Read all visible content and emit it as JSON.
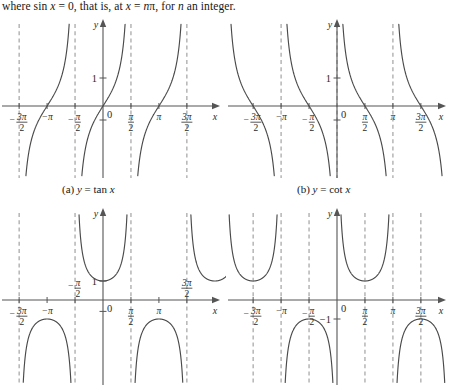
{
  "page": {
    "width": 452,
    "height": 387,
    "background": "#ffffff",
    "ink": "#2b2b2b",
    "axis_color": "#555555",
    "curve_color": "#4a4a4a",
    "asymptote_color": "#9a9a9a"
  },
  "intro": {
    "text_parts": [
      "where sin ",
      "x",
      " = 0, that is, at ",
      "x",
      " = ",
      "n",
      "π, for ",
      "n",
      " an integer."
    ],
    "full_text": "where sin x = 0, that is, at x = nπ, for n an integer."
  },
  "captions": {
    "a": {
      "prefix": "(a) ",
      "y": "y",
      "eq": " = tan ",
      "x": "x",
      "full": "(a) y = tan x"
    },
    "b": {
      "prefix": "(b) ",
      "y": "y",
      "eq": " = cot ",
      "x": "x",
      "full": "(b) y = cot x"
    }
  },
  "axis_labels": {
    "x": "x",
    "y": "y",
    "zero": "0",
    "one": "1",
    "neg_one": "−1"
  },
  "tick_labels": {
    "neg_3pi_over_2": {
      "sign": "−",
      "num": "3π",
      "den": "2"
    },
    "neg_pi": {
      "sign": "−",
      "num": "π",
      "den": ""
    },
    "neg_pi_over_2": {
      "sign": "−",
      "num": "π",
      "den": "2"
    },
    "pi_over_2": {
      "sign": "",
      "num": "π",
      "den": "2"
    },
    "pi": {
      "sign": "",
      "num": "π",
      "den": ""
    },
    "3pi_over_2": {
      "sign": "",
      "num": "3π",
      "den": "2"
    }
  },
  "chart_data": [
    {
      "id": "graph-a",
      "type": "line",
      "title": "(a) y = tan x",
      "function": "tan",
      "xlabel": "x",
      "ylabel": "y",
      "xlim": [
        -5.1,
        5.1
      ],
      "ylim": [
        -3.0,
        3.0
      ],
      "grid": false,
      "legend": false,
      "origin_px": [
        103,
        106
      ],
      "px_per_unit_x": 17.8,
      "px_per_unit_y": 28,
      "x_ticks": [
        {
          "value": -4.712,
          "label": "-3π/2"
        },
        {
          "value": -3.1416,
          "label": "-π"
        },
        {
          "value": -1.5708,
          "label": "-π/2"
        },
        {
          "value": 1.5708,
          "label": "π/2"
        },
        {
          "value": 3.1416,
          "label": "π"
        },
        {
          "value": 4.712,
          "label": "3π/2"
        }
      ],
      "y_ticks": [
        {
          "value": 1,
          "label": "1"
        },
        {
          "value": -0.5,
          "label": ""
        }
      ],
      "asymptotes": [
        -4.712,
        -1.5708,
        1.5708,
        4.712
      ],
      "branches": [
        {
          "center": -3.1416,
          "from": -4.712,
          "to": -1.5708
        },
        {
          "center": 0,
          "from": -1.5708,
          "to": 1.5708
        },
        {
          "center": 3.1416,
          "from": 1.5708,
          "to": 4.712
        }
      ]
    },
    {
      "id": "graph-b",
      "type": "line",
      "title": "(b) y = cot x",
      "function": "cot",
      "xlabel": "x",
      "ylabel": "y",
      "xlim": [
        -5.3,
        5.3
      ],
      "ylim": [
        -3.0,
        3.0
      ],
      "grid": false,
      "legend": false,
      "origin_px": [
        337,
        106
      ],
      "px_per_unit_x": 17.8,
      "px_per_unit_y": 28,
      "x_ticks": [
        {
          "value": -4.712,
          "label": "-3π/2"
        },
        {
          "value": -3.1416,
          "label": "-π"
        },
        {
          "value": -1.5708,
          "label": "-π/2"
        },
        {
          "value": 1.5708,
          "label": "π/2"
        },
        {
          "value": 3.1416,
          "label": "π"
        },
        {
          "value": 4.712,
          "label": "3π/2"
        }
      ],
      "y_ticks": [
        {
          "value": 1,
          "label": "1"
        },
        {
          "value": -0.5,
          "label": ""
        }
      ],
      "asymptotes": [
        -3.1416,
        0,
        3.1416
      ],
      "branches": [
        {
          "center": -4.712,
          "from": -6.2832,
          "to": -3.1416
        },
        {
          "center": -1.5708,
          "from": -3.1416,
          "to": 0
        },
        {
          "center": 1.5708,
          "from": 0,
          "to": 3.1416
        },
        {
          "center": 4.712,
          "from": 3.1416,
          "to": 6.2832
        }
      ]
    },
    {
      "id": "graph-c",
      "type": "line",
      "title": "y = sec x",
      "function": "sec",
      "xlabel": "x",
      "ylabel": "y",
      "xlim": [
        -5.1,
        5.1
      ],
      "ylim": [
        -3.0,
        3.0
      ],
      "grid": false,
      "legend": false,
      "origin_px": [
        103,
        300
      ],
      "px_per_unit_x": 17.8,
      "px_per_unit_y": 19,
      "x_ticks": [
        {
          "value": -4.712,
          "label": "-3π/2"
        },
        {
          "value": -3.1416,
          "label": "-π"
        },
        {
          "value": -1.5708,
          "label": "-π/2"
        },
        {
          "value": 1.5708,
          "label": "π/2"
        },
        {
          "value": 3.1416,
          "label": "π"
        },
        {
          "value": 4.712,
          "label": "3π/2"
        }
      ],
      "y_ticks": [
        {
          "value": 1,
          "label": "1"
        },
        {
          "value": -0.6,
          "label": ""
        }
      ],
      "asymptotes": [
        -4.712,
        -1.5708,
        1.5708,
        4.712
      ],
      "branches": [
        {
          "center": -3.1416,
          "from": -4.712,
          "to": -1.5708,
          "extremum": -1
        },
        {
          "center": 0,
          "from": -1.5708,
          "to": 1.5708,
          "extremum": 1
        },
        {
          "center": 3.1416,
          "from": 1.5708,
          "to": 4.712,
          "extremum": -1
        },
        {
          "center": 6.2832,
          "from": 4.712,
          "to": 7.854,
          "extremum": 1
        }
      ]
    },
    {
      "id": "graph-d",
      "type": "line",
      "title": "y = csc x",
      "function": "csc",
      "xlabel": "x",
      "ylabel": "y",
      "xlim": [
        -5.3,
        5.3
      ],
      "ylim": [
        -3.0,
        3.0
      ],
      "grid": false,
      "legend": false,
      "origin_px": [
        337,
        300
      ],
      "px_per_unit_x": 17.8,
      "px_per_unit_y": 19,
      "x_ticks": [
        {
          "value": -4.712,
          "label": "-3π/2"
        },
        {
          "value": -3.1416,
          "label": "-π"
        },
        {
          "value": -1.5708,
          "label": "-π/2"
        },
        {
          "value": 1.5708,
          "label": "π/2"
        },
        {
          "value": 3.1416,
          "label": "π"
        },
        {
          "value": 4.712,
          "label": "3π/2"
        }
      ],
      "y_ticks": [
        {
          "value": -1,
          "label": "−1"
        }
      ],
      "asymptotes": [
        -4.712,
        -3.1416,
        -1.5708,
        1.5708,
        3.1416,
        4.712
      ],
      "branches": [
        {
          "center": -4.712,
          "from": -6.2832,
          "to": -3.1416,
          "extremum": -1
        },
        {
          "center": -1.5708,
          "from": -3.1416,
          "to": 0,
          "extremum": -1
        },
        {
          "center": 1.5708,
          "from": 0,
          "to": 3.1416,
          "extremum": 1
        },
        {
          "center": 4.712,
          "from": 3.1416,
          "to": 6.2832,
          "extremum": -1
        }
      ]
    }
  ]
}
